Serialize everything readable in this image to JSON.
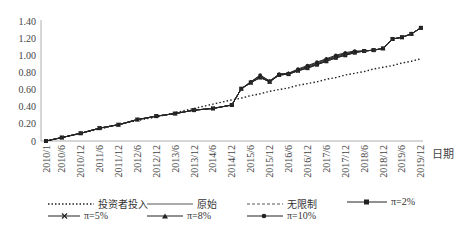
{
  "chart_data": {
    "type": "line",
    "title": "",
    "xlabel": "日期",
    "ylabel": "",
    "ylim": [
      0,
      1.4
    ],
    "yticks": [
      "0",
      "0.20",
      "0.40",
      "0.60",
      "0.80",
      "1.00",
      "1.20",
      "1.40"
    ],
    "xticks": [
      "2010/1",
      "2010/6",
      "2010/12",
      "2011/6",
      "2011/12",
      "2012/6",
      "2012/12",
      "2013/6",
      "2013/12",
      "2014/6",
      "2014/12",
      "2015/6",
      "2015/12",
      "2016/6",
      "2016/12",
      "2017/6",
      "2017/12",
      "2018/6",
      "2018/12",
      "2019/6",
      "2019/12"
    ],
    "grid": false,
    "legend_position": "bottom",
    "x": [
      "2010/1",
      "2010/6",
      "2010/12",
      "2011/6",
      "2011/12",
      "2012/6",
      "2012/12",
      "2013/6",
      "2013/12",
      "2014/6",
      "2014/12",
      "2015/3",
      "2015/6",
      "2015/9",
      "2015/12",
      "2016/3",
      "2016/6",
      "2016/9",
      "2016/12",
      "2017/3",
      "2017/6",
      "2017/9",
      "2017/12",
      "2018/3",
      "2018/6",
      "2018/9",
      "2018/12",
      "2019/3",
      "2019/6",
      "2019/9",
      "2019/12"
    ],
    "series": [
      {
        "name": "投资者投入",
        "style": "dotted",
        "values": [
          0.0,
          0.04,
          0.09,
          0.14,
          0.19,
          0.24,
          0.28,
          0.33,
          0.38,
          0.43,
          0.48,
          0.5,
          0.53,
          0.55,
          0.58,
          0.6,
          0.62,
          0.65,
          0.67,
          0.69,
          0.72,
          0.74,
          0.77,
          0.79,
          0.81,
          0.84,
          0.86,
          0.88,
          0.91,
          0.93,
          0.96
        ]
      },
      {
        "name": "原始",
        "style": "solid",
        "values": [
          0.0,
          0.04,
          0.09,
          0.15,
          0.19,
          0.25,
          0.29,
          0.32,
          0.36,
          0.38,
          0.42,
          0.61,
          0.68,
          0.74,
          0.69,
          0.77,
          0.78,
          0.82,
          0.85,
          0.89,
          0.93,
          0.97,
          1.0,
          1.03,
          1.05,
          1.06,
          1.08,
          1.19,
          1.21,
          1.25,
          1.32
        ]
      },
      {
        "name": "无限制",
        "style": "dashed",
        "values": [
          0.0,
          0.04,
          0.09,
          0.15,
          0.19,
          0.25,
          0.29,
          0.32,
          0.36,
          0.38,
          0.42,
          0.61,
          0.68,
          0.74,
          0.69,
          0.77,
          0.78,
          0.82,
          0.85,
          0.89,
          0.93,
          0.97,
          1.0,
          1.03,
          1.05,
          1.06,
          1.08,
          1.19,
          1.21,
          1.25,
          1.32
        ]
      },
      {
        "name": "π=2%",
        "style": "solid-square",
        "values": [
          0.0,
          0.04,
          0.09,
          0.15,
          0.19,
          0.25,
          0.29,
          0.32,
          0.36,
          0.38,
          0.42,
          0.61,
          0.68,
          0.74,
          0.69,
          0.77,
          0.78,
          0.82,
          0.85,
          0.89,
          0.93,
          0.97,
          1.0,
          1.03,
          1.05,
          1.06,
          1.08,
          1.19,
          1.21,
          1.25,
          1.32
        ]
      },
      {
        "name": "π=5%",
        "style": "solid-x",
        "values": [
          0.0,
          0.04,
          0.09,
          0.15,
          0.19,
          0.25,
          0.29,
          0.32,
          0.36,
          0.38,
          0.42,
          0.61,
          0.68,
          0.75,
          0.69,
          0.77,
          0.78,
          0.82,
          0.86,
          0.9,
          0.94,
          0.98,
          1.01,
          1.04,
          1.05,
          1.06,
          1.08,
          1.19,
          1.21,
          1.25,
          1.32
        ]
      },
      {
        "name": "π=8%",
        "style": "solid-triangle",
        "values": [
          0.0,
          0.04,
          0.09,
          0.15,
          0.19,
          0.25,
          0.29,
          0.32,
          0.36,
          0.38,
          0.42,
          0.61,
          0.69,
          0.76,
          0.7,
          0.78,
          0.79,
          0.83,
          0.87,
          0.91,
          0.95,
          0.99,
          1.02,
          1.04,
          1.05,
          1.06,
          1.08,
          1.19,
          1.21,
          1.25,
          1.32
        ]
      },
      {
        "name": "π=10%",
        "style": "solid-dot",
        "values": [
          0.0,
          0.04,
          0.09,
          0.15,
          0.19,
          0.25,
          0.29,
          0.32,
          0.36,
          0.38,
          0.42,
          0.61,
          0.69,
          0.77,
          0.7,
          0.78,
          0.79,
          0.84,
          0.88,
          0.92,
          0.96,
          1.0,
          1.03,
          1.05,
          1.05,
          1.06,
          1.08,
          1.19,
          1.21,
          1.25,
          1.32
        ]
      }
    ]
  },
  "legend": {
    "items": [
      {
        "label": "投资者投入",
        "marker": "dotted"
      },
      {
        "label": "原始",
        "marker": "solid"
      },
      {
        "label": "无限制",
        "marker": "dashed"
      },
      {
        "label": "π=2%",
        "marker": "square"
      },
      {
        "label": "π=5%",
        "marker": "x"
      },
      {
        "label": "π=8%",
        "marker": "triangle"
      },
      {
        "label": "π=10%",
        "marker": "dot"
      }
    ]
  }
}
